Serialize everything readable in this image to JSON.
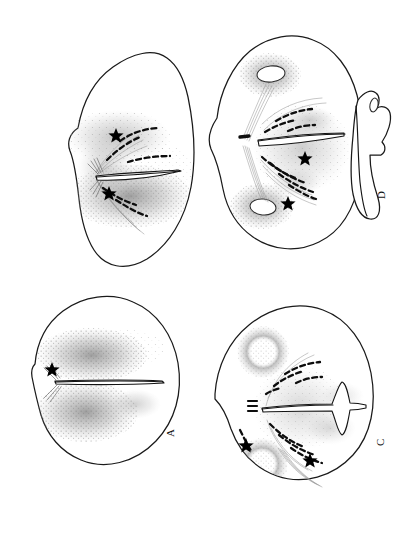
{
  "figure": {
    "kind": "line-drawing-plate",
    "background_color": "#ffffff",
    "ink_color": "#141414",
    "stipple_color": "#8c8c8c",
    "panel_count": 4,
    "panel_label_orientation": "rotated-90"
  },
  "panels": [
    {
      "id": "panel-b",
      "label": "",
      "position": "top-left",
      "shape": "rounded-triangular",
      "cleft": "long horizontal slit, narrow, tapering to the right",
      "ovals": 0,
      "stars": 2,
      "dash_arcs": 4,
      "stipple_fields": 2,
      "fiber_bundles": "radiating fan from left hilum, upper and lower sprays"
    },
    {
      "id": "panel-d",
      "label": "D",
      "position": "top-right",
      "shape": "rounded-quadrilateral with lateral lobe",
      "cleft": "horizontal wedge slit opening toward the right",
      "ovals": 2,
      "stars": 2,
      "dash_arcs": 7,
      "stipple_fields": 4,
      "fiber_bundles": "two oblique bundles linking upper and lower ovals through hilum",
      "accessory_lobe": "separate crescent lobe attached on right margin"
    },
    {
      "id": "panel-a",
      "label": "A",
      "position": "bottom-left",
      "shape": "rounded-ovoid",
      "cleft": "long straight horizontal slit, slightly tapering",
      "ovals": 0,
      "stars": 1,
      "dash_arcs": 0,
      "stipple_fields": 3,
      "fiber_bundles": "short fan of three fibers at left hilum"
    },
    {
      "id": "panel-c",
      "label": "C",
      "position": "bottom-right",
      "shape": "rounded-quadrilateral",
      "cleft": "horizontal slit with T-shaped terminal expansion on the right",
      "ovals": 2,
      "stars": 2,
      "dash_arcs": 9,
      "stipple_fields": 4,
      "fiber_bundles": "short ladder marks at hilum plus lower oblique spray"
    }
  ],
  "legend": {
    "star_marker": "★",
    "star_meaning": "landmark point",
    "dash_marker": "dashed dark band"
  }
}
